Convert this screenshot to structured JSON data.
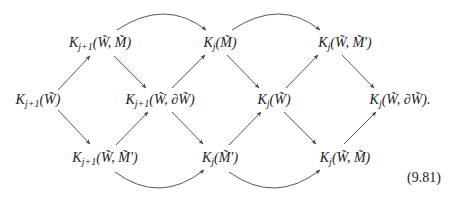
{
  "diagram": {
    "type": "commutative-diagram",
    "equation_number": "(9.81)",
    "nodes": [
      {
        "id": "n1",
        "sym": "K",
        "sub": "j+1",
        "args": "(W̃)",
        "x": 38,
        "y": 100
      },
      {
        "id": "n2",
        "sym": "K",
        "sub": "j+1",
        "args": "(W̃, M̃)",
        "x": 100,
        "y": 43
      },
      {
        "id": "n3",
        "sym": "K",
        "sub": "j+1",
        "args": "(W̃, M̃′)",
        "x": 105,
        "y": 158
      },
      {
        "id": "n4",
        "sym": "K",
        "sub": "j+1",
        "args": "(W̃, ∂W̃)",
        "x": 160,
        "y": 100
      },
      {
        "id": "n5",
        "sym": "K",
        "sub": "j",
        "args": "(M̃)",
        "x": 220,
        "y": 43
      },
      {
        "id": "n6",
        "sym": "K",
        "sub": "j",
        "args": "(M̃′)",
        "x": 220,
        "y": 158
      },
      {
        "id": "n7",
        "sym": "K",
        "sub": "j",
        "args": "(W̃)",
        "x": 274,
        "y": 100
      },
      {
        "id": "n8",
        "sym": "K",
        "sub": "j",
        "args": "(W̃, M̃′)",
        "x": 345,
        "y": 43
      },
      {
        "id": "n9",
        "sym": "K",
        "sub": "j",
        "args": "(W̃, M̃)",
        "x": 345,
        "y": 158
      },
      {
        "id": "n10",
        "sym": "K",
        "sub": "j",
        "args": "(W̃, ∂W̃).",
        "x": 400,
        "y": 100
      }
    ],
    "arrows": [
      {
        "from": "n1",
        "to": "n2",
        "kind": "straight"
      },
      {
        "from": "n1",
        "to": "n3",
        "kind": "straight"
      },
      {
        "from": "n2",
        "to": "n4",
        "kind": "straight"
      },
      {
        "from": "n3",
        "to": "n4",
        "kind": "straight"
      },
      {
        "from": "n4",
        "to": "n5",
        "kind": "straight"
      },
      {
        "from": "n4",
        "to": "n6",
        "kind": "straight"
      },
      {
        "from": "n5",
        "to": "n7",
        "kind": "straight"
      },
      {
        "from": "n6",
        "to": "n7",
        "kind": "straight"
      },
      {
        "from": "n7",
        "to": "n8",
        "kind": "straight"
      },
      {
        "from": "n7",
        "to": "n9",
        "kind": "straight"
      },
      {
        "from": "n8",
        "to": "n10",
        "kind": "straight"
      },
      {
        "from": "n9",
        "to": "n10",
        "kind": "straight"
      },
      {
        "from": "n2",
        "to": "n5",
        "kind": "arc-over"
      },
      {
        "from": "n5",
        "to": "n8",
        "kind": "arc-over"
      },
      {
        "from": "n3",
        "to": "n6",
        "kind": "arc-under"
      },
      {
        "from": "n6",
        "to": "n9",
        "kind": "arc-under"
      }
    ],
    "colors": {
      "text": "#222222",
      "arrow": "#444444",
      "background": "#ffffff"
    }
  }
}
